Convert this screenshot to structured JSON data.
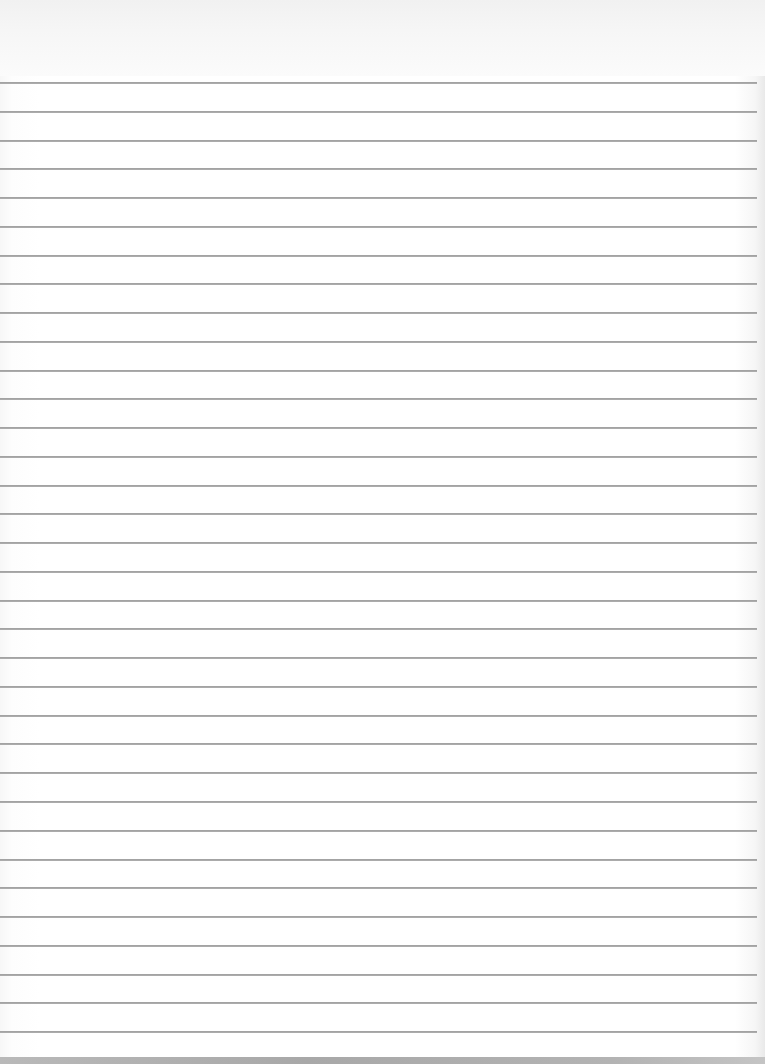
{
  "document": {
    "type": "lined-paper",
    "content_text": "",
    "rule_count": 34,
    "first_rule_y": 82,
    "rule_spacing": 28.76,
    "rule_left": 0,
    "rule_right": 757,
    "colors": {
      "paper": "#ffffff",
      "rule": "#9a9a9a",
      "top_band": "#f3f3f3",
      "bottom_edge": "#b0b0b0"
    }
  }
}
